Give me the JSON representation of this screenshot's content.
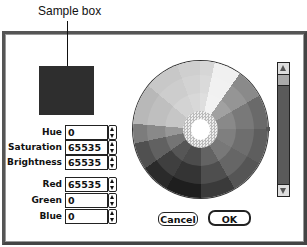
{
  "annotation": {
    "caption": "Sample box"
  },
  "dialog": {
    "sample_color": "#2e2e2e",
    "hsb": {
      "hue_label": "Hue",
      "hue_value": "0",
      "saturation_label": "Saturation",
      "saturation_value": "65535",
      "brightness_label": "Brightness",
      "brightness_value": "65535"
    },
    "rgb": {
      "red_label": "Red",
      "red_value": "65535",
      "green_label": "Green",
      "green_value": "0",
      "blue_label": "Blue",
      "blue_value": "0"
    },
    "buttons": {
      "cancel": "Cancel",
      "ok": "OK"
    }
  }
}
